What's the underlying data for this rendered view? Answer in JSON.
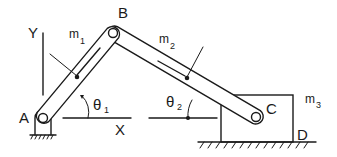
{
  "diagram": {
    "type": "slider-crank mechanism",
    "stroke_color": "#1a1a1a",
    "background": "#ffffff",
    "labels": {
      "A": "A",
      "B": "B",
      "C": "C",
      "D": "D",
      "X": "X",
      "Y": "Y",
      "m1": "m",
      "m1_sub": "1",
      "m2": "m",
      "m2_sub": "2",
      "m3": "m",
      "m3_sub": "3",
      "theta1": "θ",
      "theta1_sub": "1",
      "theta2": "θ",
      "theta2_sub": "2"
    },
    "components": [
      {
        "name": "link-1",
        "from": "A",
        "to": "B",
        "mass": "m1"
      },
      {
        "name": "link-2",
        "from": "B",
        "to": "C",
        "mass": "m2"
      },
      {
        "name": "slider-block",
        "mass": "m3",
        "corner": "D"
      },
      {
        "name": "ground-pivot",
        "at": "A"
      },
      {
        "name": "ground-rail",
        "under": "slider-block"
      }
    ]
  }
}
